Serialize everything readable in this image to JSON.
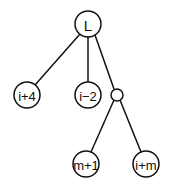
{
  "diagram": {
    "type": "tree",
    "colors": {
      "stroke": "#111111",
      "background": "#ffffff"
    },
    "nodes": [
      {
        "id": "root",
        "label": "L",
        "cx": 88,
        "cy": 24,
        "r": 13
      },
      {
        "id": "n1",
        "label": "i+4",
        "cx": 27,
        "cy": 95,
        "r": 13
      },
      {
        "id": "n2",
        "label": "i−2",
        "cx": 88,
        "cy": 95,
        "r": 13
      },
      {
        "id": "n3",
        "label": "",
        "cx": 117,
        "cy": 95,
        "r": 6
      },
      {
        "id": "n4",
        "label": "m+1",
        "cx": 86,
        "cy": 164,
        "r": 13
      },
      {
        "id": "n5",
        "label": "i+m",
        "cx": 146,
        "cy": 164,
        "r": 13
      }
    ],
    "edges": [
      {
        "from": "root",
        "to": "n1"
      },
      {
        "from": "root",
        "to": "n2"
      },
      {
        "from": "root",
        "to": "n3"
      },
      {
        "from": "n3",
        "to": "n4"
      },
      {
        "from": "n3",
        "to": "n5"
      }
    ]
  }
}
